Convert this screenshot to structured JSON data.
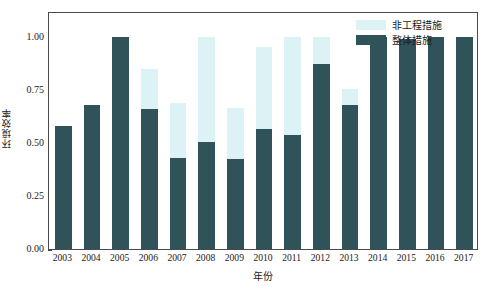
{
  "chart_data": {
    "type": "bar",
    "title": "",
    "xlabel": "年份",
    "ylabel": "环境效率",
    "categories": [
      "2003",
      "2004",
      "2005",
      "2006",
      "2007",
      "2008",
      "2009",
      "2010",
      "2011",
      "2012",
      "2013",
      "2014",
      "2015",
      "2016",
      "2017"
    ],
    "series": [
      {
        "name": "非工程措施",
        "color": "#ddf2f5",
        "values": [
          0.58,
          0.68,
          1.0,
          0.85,
          0.69,
          1.0,
          0.665,
          0.955,
          1.0,
          1.0,
          0.755,
          1.0,
          0.995,
          1.0,
          1.0
        ]
      },
      {
        "name": "整体措施",
        "color": "#2f5358",
        "values": [
          0.58,
          0.68,
          1.0,
          0.66,
          0.43,
          0.505,
          0.425,
          0.565,
          0.54,
          0.875,
          0.68,
          1.0,
          0.995,
          1.0,
          1.0
        ]
      }
    ],
    "ylim": [
      0.0,
      1.125
    ],
    "yticks": [
      0.0,
      0.25,
      0.5,
      0.75,
      1.0
    ],
    "ytick_labels": [
      "0.00",
      "0.25",
      "0.50",
      "0.75",
      "1.00"
    ],
    "grid": false,
    "legend_position": "top-right",
    "overlap_style": "overlaid"
  },
  "axes": {
    "frame_color": "#4a4a4a"
  }
}
